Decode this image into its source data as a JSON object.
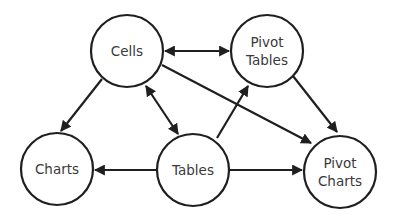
{
  "diagram": {
    "nodes": [
      {
        "id": "cells",
        "lines": [
          "Cells"
        ],
        "cx": 127,
        "cy": 51,
        "r": 36
      },
      {
        "id": "pivot_tables",
        "lines": [
          "Pivot",
          "Tables"
        ],
        "cx": 267,
        "cy": 51,
        "r": 36
      },
      {
        "id": "charts",
        "lines": [
          "Charts"
        ],
        "cx": 57,
        "cy": 169,
        "r": 36
      },
      {
        "id": "tables",
        "lines": [
          "Tables"
        ],
        "cx": 193,
        "cy": 170,
        "r": 36
      },
      {
        "id": "pivot_charts",
        "lines": [
          "Pivot",
          "Charts"
        ],
        "cx": 340,
        "cy": 172,
        "r": 36
      }
    ],
    "edges": [
      {
        "from": "cells",
        "to": "pivot_tables",
        "bidirectional": true
      },
      {
        "from": "cells",
        "to": "charts",
        "bidirectional": false
      },
      {
        "from": "cells",
        "to": "tables",
        "bidirectional": true
      },
      {
        "from": "cells",
        "to": "pivot_charts",
        "bidirectional": false
      },
      {
        "from": "tables",
        "to": "pivot_tables",
        "bidirectional": false
      },
      {
        "from": "pivot_tables",
        "to": "pivot_charts",
        "bidirectional": false
      },
      {
        "from": "tables",
        "to": "charts",
        "bidirectional": false
      },
      {
        "from": "tables",
        "to": "pivot_charts",
        "bidirectional": false
      }
    ],
    "colors": {
      "stroke": "#1f1f1f",
      "text": "#3a3a3a",
      "background": "#ffffff"
    }
  },
  "labels": {
    "cells": "Cells",
    "pivot_tables_1": "Pivot",
    "pivot_tables_2": "Tables",
    "charts": "Charts",
    "tables": "Tables",
    "pivot_charts_1": "Pivot",
    "pivot_charts_2": "Charts"
  }
}
